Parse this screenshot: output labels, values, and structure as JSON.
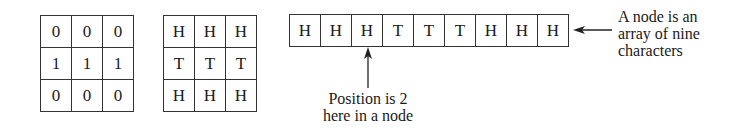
{
  "figure": {
    "binary_grid": {
      "rows": [
        [
          "0",
          "0",
          "0"
        ],
        [
          "1",
          "1",
          "1"
        ],
        [
          "0",
          "0",
          "0"
        ]
      ]
    },
    "coin_grid": {
      "rows": [
        [
          "H",
          "H",
          "H"
        ],
        [
          "T",
          "T",
          "T"
        ],
        [
          "H",
          "H",
          "H"
        ]
      ]
    },
    "node_array": {
      "cells": [
        "H",
        "H",
        "H",
        "T",
        "T",
        "T",
        "H",
        "H",
        "H"
      ],
      "highlighted_position": 2
    },
    "annotations": {
      "position_label": [
        "Position is 2",
        "here in a node"
      ],
      "node_label": [
        "A node is an",
        "array of nine",
        "characters"
      ]
    },
    "colors": {
      "line": "#333333",
      "text": "#1a1a1a",
      "background": "#ffffff"
    }
  }
}
